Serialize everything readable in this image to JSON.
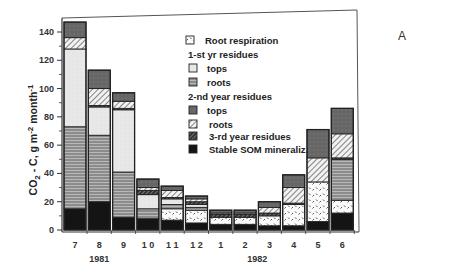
{
  "chart_data": {
    "type": "bar",
    "stacked": true,
    "panel_label": "A",
    "title": "",
    "xlabel": "",
    "ylabel": "CO2 - C, g m-2 month-1",
    "ylabel_parts": {
      "main": "CO",
      "sub": "2",
      "mid": " -  C,  g  m",
      "sup1": "-2",
      "mid2": " month",
      "sup2": "-1"
    },
    "ylim": [
      0,
      150
    ],
    "yticks": [
      0,
      20,
      40,
      60,
      80,
      100,
      120,
      140
    ],
    "categories": [
      "7",
      "8",
      "9",
      "1 0",
      "1 1",
      "1 2",
      "1",
      "2",
      "3",
      "4",
      "5",
      "6"
    ],
    "year_labels": [
      {
        "label": "1981",
        "center_index": 1
      },
      {
        "label": "1982",
        "center_index": 7.5
      }
    ],
    "legend": {
      "position": "upper-center",
      "entries": [
        {
          "type": "item",
          "key": "root_resp",
          "label": "Root respiration"
        },
        {
          "type": "header",
          "label": "1-st yr residues"
        },
        {
          "type": "item",
          "key": "r1_tops",
          "label": "tops"
        },
        {
          "type": "item",
          "key": "r1_roots",
          "label": "roots"
        },
        {
          "type": "header",
          "label": "2-nd year residues"
        },
        {
          "type": "item",
          "key": "r2_tops",
          "label": "tops"
        },
        {
          "type": "item",
          "key": "r2_roots",
          "label": "roots"
        },
        {
          "type": "item",
          "key": "r3",
          "label": "3-rd year residues"
        },
        {
          "type": "item",
          "key": "som",
          "label": "Stable SOM mineraliz."
        }
      ]
    },
    "stack_order_bottom_to_top": [
      "som",
      "root_resp",
      "r1_roots",
      "r1_tops",
      "r3",
      "r2_roots",
      "r2_tops"
    ],
    "series": [
      {
        "name": "Stable SOM mineraliz.",
        "key": "som",
        "values": [
          15,
          20,
          9,
          8,
          7,
          5,
          4,
          4,
          3,
          3,
          6,
          12
        ]
      },
      {
        "name": "Root respiration",
        "key": "root_resp",
        "values": [
          0,
          0,
          0,
          0,
          8,
          9,
          5,
          5,
          7,
          15,
          28,
          9
        ]
      },
      {
        "name": "1-st yr roots",
        "key": "r1_roots",
        "values": [
          58,
          47,
          32,
          7,
          3,
          2,
          0,
          0,
          0,
          0,
          0,
          29
        ]
      },
      {
        "name": "1-st yr tops",
        "key": "r1_tops",
        "values": [
          55,
          20,
          44,
          10,
          4,
          2,
          0,
          0,
          0,
          0,
          0,
          0
        ]
      },
      {
        "name": "3-rd year residues",
        "key": "r3",
        "values": [
          0,
          1,
          1,
          3,
          1,
          2,
          2,
          2,
          2,
          1,
          0,
          1
        ]
      },
      {
        "name": "2-nd yr roots",
        "key": "r2_roots",
        "values": [
          8,
          12,
          5,
          2,
          5,
          2,
          1,
          1,
          4,
          11,
          17,
          17
        ]
      },
      {
        "name": "2-nd yr tops",
        "key": "r2_tops",
        "values": [
          11,
          13,
          6,
          6,
          3,
          2,
          2,
          2,
          4,
          9,
          20,
          18
        ]
      }
    ],
    "totals": [
      147,
      113,
      97,
      36,
      31,
      24,
      14,
      14,
      20,
      39,
      71,
      86
    ],
    "grid": false
  },
  "colors": {
    "som": "#111111",
    "root_resp": "#f4f4f4",
    "r1_roots": "#8a8a8a",
    "r1_tops": "#e6e6e6",
    "r3": "#4a4a4a",
    "r2_roots": "#d8d8d8",
    "r2_tops": "#5e5e5e"
  }
}
